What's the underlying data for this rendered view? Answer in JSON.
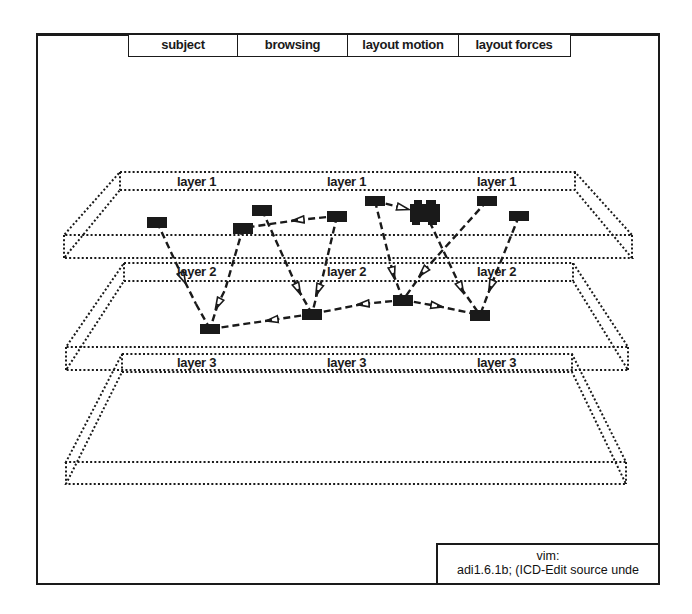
{
  "menu": {
    "items": [
      {
        "label": "subject",
        "width": 110
      },
      {
        "label": "browsing",
        "width": 111
      },
      {
        "label": "layout motion",
        "width": 111
      },
      {
        "label": "layout forces",
        "width": 112
      }
    ]
  },
  "layers": [
    {
      "name": "layer 1",
      "labels": [
        "layer 1",
        "layer 1",
        "layer 1"
      ]
    },
    {
      "name": "layer 2",
      "labels": [
        "layer 2",
        "layer 2",
        "layer 2"
      ]
    },
    {
      "name": "layer 3",
      "labels": [
        "layer 3",
        "layer 3",
        "layer 3"
      ]
    }
  ],
  "graph": {
    "node_color": "#1a1a1a",
    "nodes": [
      {
        "id": "A",
        "layer": 1,
        "x": 157,
        "y": 222
      },
      {
        "id": "B",
        "layer": 1,
        "x": 243,
        "y": 228
      },
      {
        "id": "C",
        "layer": 1,
        "x": 262,
        "y": 210
      },
      {
        "id": "D",
        "layer": 1,
        "x": 337,
        "y": 216
      },
      {
        "id": "E",
        "layer": 1,
        "x": 375,
        "y": 201
      },
      {
        "id": "F",
        "layer": 1,
        "x": 425,
        "y": 212,
        "cluster": true
      },
      {
        "id": "G",
        "layer": 1,
        "x": 487,
        "y": 201
      },
      {
        "id": "H",
        "layer": 1,
        "x": 519,
        "y": 216
      },
      {
        "id": "I",
        "layer": 2,
        "x": 210,
        "y": 329
      },
      {
        "id": "J",
        "layer": 2,
        "x": 312,
        "y": 314
      },
      {
        "id": "K",
        "layer": 2,
        "x": 403,
        "y": 300
      },
      {
        "id": "L",
        "layer": 2,
        "x": 480,
        "y": 315
      }
    ],
    "edges": [
      {
        "from": "A",
        "to": "I"
      },
      {
        "from": "B",
        "to": "I"
      },
      {
        "from": "C",
        "to": "J"
      },
      {
        "from": "D",
        "to": "J"
      },
      {
        "from": "D",
        "to": "B"
      },
      {
        "from": "E",
        "to": "F"
      },
      {
        "from": "E",
        "to": "K"
      },
      {
        "from": "G",
        "to": "K"
      },
      {
        "from": "F",
        "to": "L"
      },
      {
        "from": "H",
        "to": "L"
      },
      {
        "from": "J",
        "to": "I"
      },
      {
        "from": "K",
        "to": "J"
      },
      {
        "from": "K",
        "to": "L"
      }
    ]
  },
  "status": {
    "title": "vim:",
    "message": "adi1.6.1b; (ICD-Edit source unde"
  }
}
